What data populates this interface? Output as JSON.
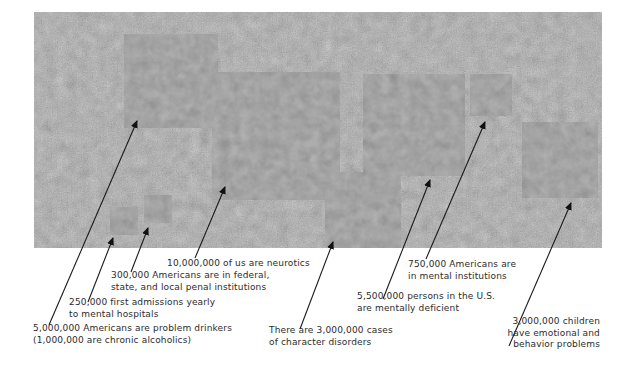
{
  "figure": {
    "background_photo": "crowd-photo",
    "circle_color": "#5a5a5a",
    "line_color": "#1a1a1a"
  },
  "items": [
    {
      "id": "problem-drinkers",
      "lines": [
        "5,000,000 Americans are problem drinkers",
        "(1,000,000 are chronic alcoholics)"
      ],
      "value": 5000000,
      "circle": {
        "cx": 171,
        "cy": 81,
        "r": 47
      },
      "arrow_tip": [
        137,
        121
      ],
      "line_end": [
        49,
        325
      ],
      "label_pos": [
        33,
        323
      ]
    },
    {
      "id": "first-admissions",
      "lines": [
        "250,000 first admissions yearly",
        "to mental hospitals"
      ],
      "value": 250000,
      "circle": {
        "cx": 124,
        "cy": 221,
        "r": 14
      },
      "arrow_tip": [
        113,
        238
      ],
      "line_end": [
        88,
        302
      ],
      "label_pos": [
        69,
        297
      ]
    },
    {
      "id": "penal-institutions",
      "lines": [
        "300,000 Americans are in federal,",
        "state, and local penal institutions"
      ],
      "value": 300000,
      "circle": {
        "cx": 158,
        "cy": 209,
        "r": 14
      },
      "arrow_tip": [
        148,
        228
      ],
      "line_end": [
        131,
        272
      ],
      "label_pos": [
        111,
        270
      ]
    },
    {
      "id": "neurotics",
      "lines": [
        "10,000,000 of us are neurotics"
      ],
      "value": 10000000,
      "circle": {
        "cx": 276,
        "cy": 136,
        "r": 64
      },
      "arrow_tip": [
        225,
        187
      ],
      "line_end": [
        195,
        258
      ],
      "label_pos": [
        167,
        258
      ]
    },
    {
      "id": "character-disorders",
      "lines": [
        "There are 3,000,000 cases",
        "of character disorders"
      ],
      "value": 3000000,
      "circle": {
        "cx": 363,
        "cy": 210,
        "r": 38
      },
      "arrow_tip": [
        333,
        242
      ],
      "line_end": [
        300,
        329
      ],
      "label_pos": [
        269,
        325
      ]
    },
    {
      "id": "mentally-deficient",
      "lines": [
        "5,500,000 persons in the U.S.",
        "are mentally deficient"
      ],
      "value": 5500000,
      "circle": {
        "cx": 414,
        "cy": 125,
        "r": 51
      },
      "arrow_tip": [
        430,
        180
      ],
      "line_end": [
        383,
        299
      ],
      "label_pos": [
        357,
        291
      ]
    },
    {
      "id": "mental-institutions",
      "lines": [
        "750,000 Americans are",
        "in mental institutions"
      ],
      "value": 750000,
      "circle": {
        "cx": 491,
        "cy": 95,
        "r": 21
      },
      "arrow_tip": [
        485,
        122
      ],
      "line_end": [
        426,
        259
      ],
      "label_pos": [
        408,
        259
      ]
    },
    {
      "id": "children-problems",
      "lines": [
        "3,000,000 children",
        "have emotional and",
        "behavior problems"
      ],
      "value": 3000000,
      "circle": {
        "cx": 560,
        "cy": 160,
        "r": 38
      },
      "arrow_tip": [
        571,
        203
      ],
      "line_end": [
        509,
        346
      ],
      "label_pos": [
        600,
        316
      ],
      "align": "right"
    }
  ]
}
